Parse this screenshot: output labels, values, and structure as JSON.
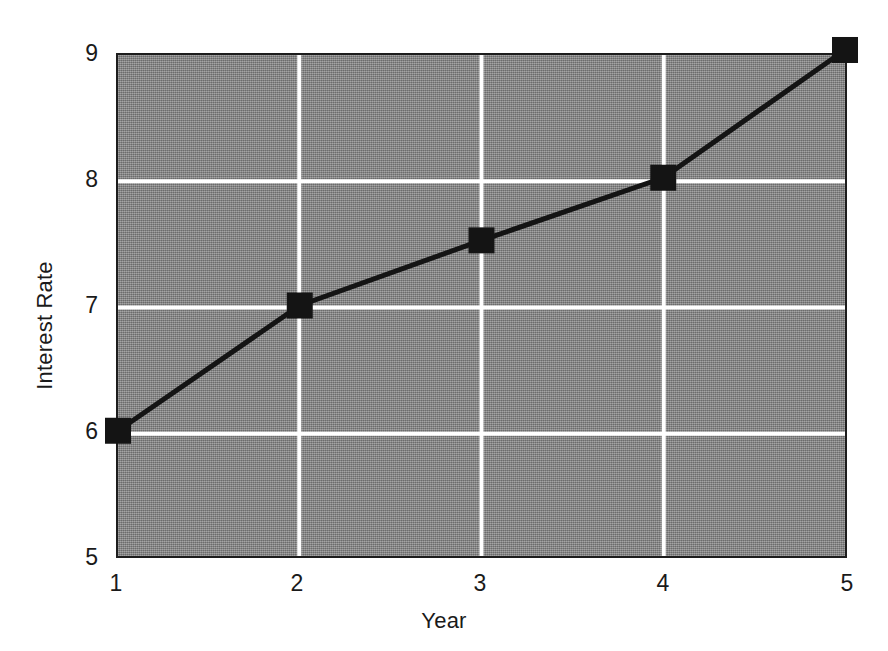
{
  "chart_data": {
    "type": "line",
    "title": "",
    "xlabel": "Year",
    "ylabel": "Interest Rate",
    "x": [
      1,
      2,
      3,
      4,
      5
    ],
    "values": [
      6.0,
      7.0,
      7.52,
      8.02,
      9.04
    ],
    "series": [
      {
        "name": "Interest Rate",
        "values": [
          6.0,
          7.0,
          7.52,
          8.02,
          9.04
        ]
      }
    ],
    "xlim": [
      1,
      5
    ],
    "ylim": [
      5,
      9
    ],
    "x_ticks": [
      "1",
      "2",
      "3",
      "4",
      "5"
    ],
    "y_ticks": [
      "5",
      "6",
      "7",
      "8",
      "9"
    ],
    "x_tick_values": [
      1,
      2,
      3,
      4,
      5
    ],
    "y_tick_values": [
      5,
      6,
      7,
      8,
      9
    ],
    "grid": true,
    "grid_color": "#ffffff",
    "grid_axes": "both",
    "legend": false,
    "legend_position": "none",
    "marker": "square",
    "marker_color": "#141414",
    "line_color": "#141414",
    "plot_background_color": "#8a8a8a",
    "figure_background_color": "#ffffff",
    "axis_border_color": "#1d1d1d"
  },
  "axes": {
    "y_title": "Interest Rate",
    "x_title": "Year",
    "y_tick_labels": [
      "9",
      "8",
      "7",
      "6",
      "5"
    ],
    "x_tick_labels": [
      "1",
      "2",
      "3",
      "4",
      "5"
    ]
  }
}
